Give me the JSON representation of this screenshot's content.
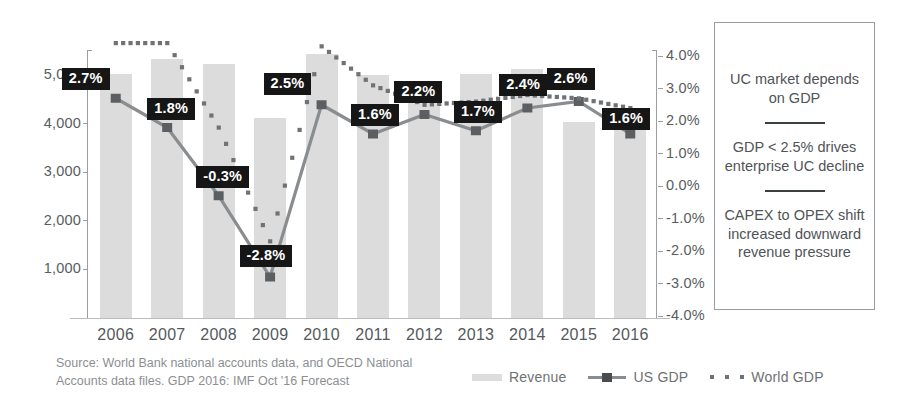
{
  "chart_data": {
    "type": "bar",
    "title": "",
    "subtitle": "",
    "xlabel": "",
    "ylabel": "",
    "grid": false,
    "legend_position": "bottom",
    "categories": [
      "2006",
      "2007",
      "2008",
      "2009",
      "2010",
      "2011",
      "2012",
      "2013",
      "2014",
      "2015",
      "2016"
    ],
    "left_axis": {
      "ticks": [
        "5,000",
        "4,000",
        "3,000",
        "2,000",
        "1,000"
      ],
      "tick_values": [
        5000,
        4000,
        3000,
        2000,
        1000
      ],
      "range": [
        0,
        5600
      ]
    },
    "right_axis": {
      "ticks": [
        "4.0%",
        "3.0%",
        "2.0%",
        "1.0%",
        "0.0%",
        "-1.0%",
        "-2.0%",
        "-3.0%",
        "-4.0%"
      ],
      "tick_values": [
        4.0,
        3.0,
        2.0,
        1.0,
        0.0,
        -1.0,
        -2.0,
        -3.0,
        -4.0
      ],
      "range": [
        -4.0,
        4.0
      ]
    },
    "series": [
      {
        "name": "Revenue",
        "type": "bar",
        "axis": "left",
        "color": "#dcdcdc",
        "values": [
          5020,
          5320,
          5230,
          4120,
          5430,
          5010,
          4660,
          5030,
          5130,
          4030,
          3860
        ]
      },
      {
        "name": "US GDP",
        "type": "line",
        "axis": "right",
        "color": "#8a8d8f",
        "values": [
          2.7,
          1.8,
          -0.3,
          -2.8,
          2.5,
          1.6,
          2.2,
          1.7,
          2.4,
          2.6,
          1.6
        ],
        "labels": [
          "2.7%",
          "1.8%",
          "-0.3%",
          "-2.8%",
          "2.5%",
          "1.6%",
          "2.2%",
          "1.7%",
          "2.4%",
          "2.6%",
          "1.6%"
        ]
      },
      {
        "name": "World GDP",
        "type": "line-dotted",
        "axis": "right",
        "color": "#6f7376",
        "values": [
          4.4,
          4.4,
          1.8,
          -1.7,
          4.3,
          3.1,
          2.5,
          2.6,
          2.8,
          2.7,
          2.4
        ]
      }
    ]
  },
  "callout": {
    "line1": "UC market depends on GDP",
    "line2": "GDP < 2.5% drives enterprise UC decline",
    "line3": "CAPEX to OPEX shift increased downward revenue pressure"
  },
  "footer": {
    "source_line1": "Source: World Bank national accounts data, and OECD National",
    "source_line2": "Accounts data files. GDP 2016: IMF Oct '16 Forecast",
    "legend": {
      "revenue": "Revenue",
      "us_gdp": "US GDP",
      "world_gdp": "World GDP"
    }
  }
}
